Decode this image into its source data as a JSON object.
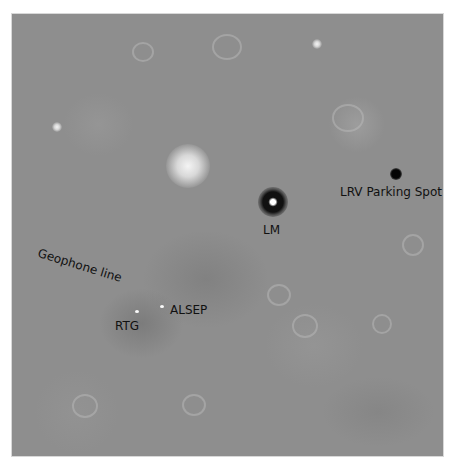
{
  "image": {
    "description": "Lunar surface orbital image with annotated landing site features",
    "background_color": "#8e8e8e"
  },
  "labels": {
    "lm": "LM",
    "lrv": "LRV Parking Spot",
    "geophone": "Geophone line",
    "alsep": "ALSEP",
    "rtg": "RTG"
  }
}
